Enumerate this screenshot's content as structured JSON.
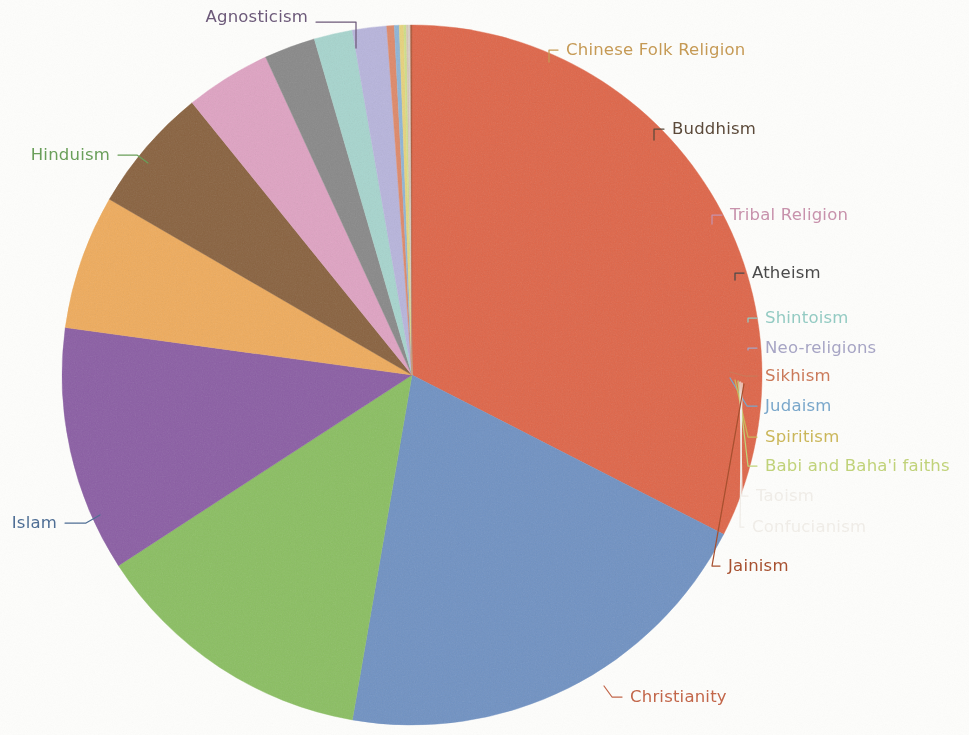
{
  "figure": {
    "background_color": "#fdfdfb",
    "center_x": 412,
    "center_y": 375,
    "radius": 350
  },
  "chart_data": {
    "type": "pie",
    "title": "",
    "subtitle": "",
    "xlabel": "",
    "ylabel": "",
    "legend_position": "none",
    "labels_position": "outside-with-leader-lines",
    "grid": false,
    "start_angle_deg": -90,
    "direction": "clockwise",
    "categories": [
      "Christianity",
      "Islam",
      "Hinduism",
      "Agnosticism",
      "Chinese Folk Religion",
      "Buddhism",
      "Tribal Religion",
      "Atheism",
      "Shintoism",
      "Neo-religions",
      "Sikhism",
      "Judaism",
      "Spiritism",
      "Babi and Baha'i faiths",
      "Taoism",
      "Confucianism",
      "Jainism"
    ],
    "values": [
      33.0,
      20.5,
      13.3,
      11.5,
      6.3,
      5.9,
      4.0,
      2.4,
      1.8,
      1.6,
      0.35,
      0.23,
      0.21,
      0.12,
      0.1,
      0.09,
      0.07
    ],
    "unit": "percent of world population",
    "colors": [
      "#e0674a",
      "#7193c4",
      "#8cc063",
      "#8c5fa5",
      "#f0ad5e",
      "#8a6340",
      "#e0a4c4",
      "#8a8a8a",
      "#a8d6cf",
      "#b9b6dd",
      "#e08a6a",
      "#8fb6d8",
      "#e8d47e",
      "#cfe08a",
      "#d8c8b8",
      "#d8d2c8",
      "#b05a3c"
    ],
    "series": [
      {
        "name": "World population share",
        "values": [
          33.0,
          20.5,
          13.3,
          11.5,
          6.3,
          5.9,
          4.0,
          2.4,
          1.8,
          1.6,
          0.35,
          0.23,
          0.21,
          0.12,
          0.1,
          0.09,
          0.07
        ]
      }
    ]
  },
  "labels": [
    {
      "id": "agnosticism",
      "text": "Agnosticism",
      "color": "#6d5a7a",
      "x": 308,
      "y": 17,
      "anchor": "end",
      "size": "md",
      "leader": [
        [
          316,
          22
        ],
        [
          356,
          22
        ],
        [
          356,
          48
        ]
      ]
    },
    {
      "id": "chinese-folk",
      "text": "Chinese Folk Religion",
      "color": "#c79b55",
      "x": 566,
      "y": 50,
      "anchor": "start",
      "size": "md",
      "leader": [
        [
          558,
          50
        ],
        [
          549,
          50
        ],
        [
          549,
          62
        ]
      ]
    },
    {
      "id": "buddhism",
      "text": "Buddhism",
      "color": "#5c4a3a",
      "x": 672,
      "y": 129,
      "anchor": "start",
      "size": "md",
      "leader": [
        [
          664,
          129
        ],
        [
          654,
          129
        ],
        [
          654,
          140
        ]
      ]
    },
    {
      "id": "tribal-religion",
      "text": "Tribal Religion",
      "color": "#c993ad",
      "x": 730,
      "y": 215,
      "anchor": "start",
      "size": "md",
      "leader": [
        [
          722,
          215
        ],
        [
          712,
          215
        ],
        [
          712,
          224
        ]
      ]
    },
    {
      "id": "atheism",
      "text": "Atheism",
      "color": "#4a4a4a",
      "x": 752,
      "y": 273,
      "anchor": "start",
      "size": "md",
      "leader": [
        [
          744,
          273
        ],
        [
          735,
          273
        ],
        [
          735,
          280
        ]
      ]
    },
    {
      "id": "shintoism",
      "text": "Shintoism",
      "color": "#94ccc4",
      "x": 765,
      "y": 318,
      "anchor": "start",
      "size": "md",
      "leader": [
        [
          757,
          318
        ],
        [
          748,
          318
        ],
        [
          748,
          322
        ]
      ]
    },
    {
      "id": "neo-religions",
      "text": "Neo-religions",
      "color": "#a8a6c6",
      "x": 765,
      "y": 348,
      "anchor": "start",
      "size": "md",
      "leader": [
        [
          757,
          348
        ],
        [
          748,
          348
        ],
        [
          748,
          350
        ]
      ]
    },
    {
      "id": "sikhism",
      "text": "Sikhism",
      "color": "#cc7a5a",
      "x": 765,
      "y": 376,
      "anchor": "start",
      "size": "md",
      "leader": [
        [
          757,
          376
        ],
        [
          745,
          376
        ],
        [
          730,
          372
        ]
      ]
    },
    {
      "id": "judaism",
      "text": "Judaism",
      "color": "#7aa8cc",
      "x": 765,
      "y": 406,
      "anchor": "start",
      "size": "md",
      "leader": [
        [
          757,
          406
        ],
        [
          747,
          406
        ],
        [
          730,
          378
        ]
      ]
    },
    {
      "id": "spiritism",
      "text": "Spiritism",
      "color": "#ccb85a",
      "x": 765,
      "y": 437,
      "anchor": "start",
      "size": "md",
      "leader": [
        [
          757,
          437
        ],
        [
          748,
          437
        ],
        [
          735,
          380
        ]
      ]
    },
    {
      "id": "babi-bahai",
      "text": "Babi and Baha'i faiths",
      "color": "#c2d47a",
      "x": 765,
      "y": 466,
      "anchor": "start",
      "size": "md",
      "leader": [
        [
          757,
          466
        ],
        [
          748,
          466
        ],
        [
          738,
          381
        ]
      ]
    },
    {
      "id": "taoism",
      "text": "Taoism",
      "color": "#f1eee9",
      "x": 756,
      "y": 496,
      "anchor": "start",
      "size": "md",
      "leader": [
        [
          748,
          496
        ],
        [
          742,
          496
        ],
        [
          740,
          382
        ]
      ]
    },
    {
      "id": "confucianism",
      "text": "Confucianism",
      "color": "#f1eee9",
      "x": 752,
      "y": 527,
      "anchor": "start",
      "size": "md",
      "leader": [
        [
          744,
          527
        ],
        [
          740,
          527
        ],
        [
          742,
          383
        ]
      ]
    },
    {
      "id": "jainism",
      "text": "Jainism",
      "color": "#a8502f",
      "x": 728,
      "y": 566,
      "anchor": "start",
      "size": "md",
      "leader": [
        [
          720,
          566
        ],
        [
          712,
          566
        ],
        [
          744,
          384
        ]
      ]
    },
    {
      "id": "christianity",
      "text": "Christianity",
      "color": "#c4674a",
      "x": 630,
      "y": 697,
      "anchor": "start",
      "size": "md",
      "leader": [
        [
          622,
          697
        ],
        [
          612,
          697
        ],
        [
          604,
          686
        ]
      ]
    },
    {
      "id": "islam",
      "text": "Islam",
      "color": "#4f6f96",
      "x": 57,
      "y": 523,
      "anchor": "end",
      "size": "md",
      "leader": [
        [
          65,
          523
        ],
        [
          86,
          523
        ],
        [
          100,
          515
        ]
      ]
    },
    {
      "id": "hinduism",
      "text": "Hinduism",
      "color": "#6aa05a",
      "x": 110,
      "y": 155,
      "anchor": "end",
      "size": "md",
      "leader": [
        [
          118,
          155
        ],
        [
          137,
          155
        ],
        [
          148,
          163
        ]
      ]
    }
  ]
}
